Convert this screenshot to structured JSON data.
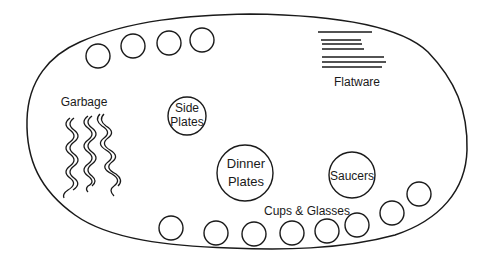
{
  "diagram": {
    "type": "table-setting-layout",
    "labels": {
      "garbage": "Garbage",
      "flatware": "Flatware",
      "side_plates_line1": "Side",
      "side_plates_line2": "Plates",
      "dinner_plates_line1": "Dinner",
      "dinner_plates_line2": "Plates",
      "saucers": "Saucers",
      "cups_glasses": "Cups & Glasses"
    },
    "top_circles_count": 4,
    "bottom_circles_count": 8,
    "stroke_color": "#1a1a1a",
    "background_color": "#ffffff"
  }
}
